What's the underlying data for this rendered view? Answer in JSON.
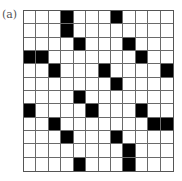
{
  "figure": {
    "label": "(a)",
    "rows": 12,
    "cols": 12,
    "colors": {
      "filled": "#000000",
      "empty": "#ffffff",
      "gridline": "#6a6a6a"
    },
    "black_cells": [
      [
        3,
        7
      ],
      [
        3
      ],
      [
        4,
        8
      ],
      [
        0,
        1,
        9
      ],
      [
        2,
        6,
        11
      ],
      [
        7
      ],
      [
        4
      ],
      [
        0,
        5,
        9
      ],
      [
        2,
        10,
        11
      ],
      [
        3,
        7
      ],
      [
        8
      ],
      [
        4,
        8
      ]
    ]
  }
}
